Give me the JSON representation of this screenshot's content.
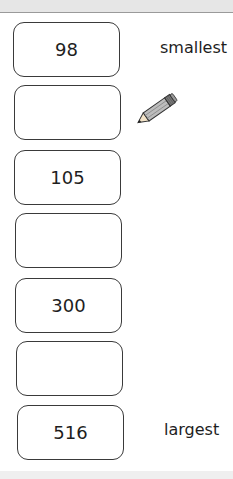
{
  "boxes": [
    {
      "value": "98"
    },
    {
      "value": ""
    },
    {
      "value": "105"
    },
    {
      "value": ""
    },
    {
      "value": "300"
    },
    {
      "value": ""
    },
    {
      "value": "516"
    }
  ],
  "labels": {
    "smallest": "smallest",
    "largest": "largest"
  },
  "icons": {
    "pencil": "pencil-icon"
  }
}
